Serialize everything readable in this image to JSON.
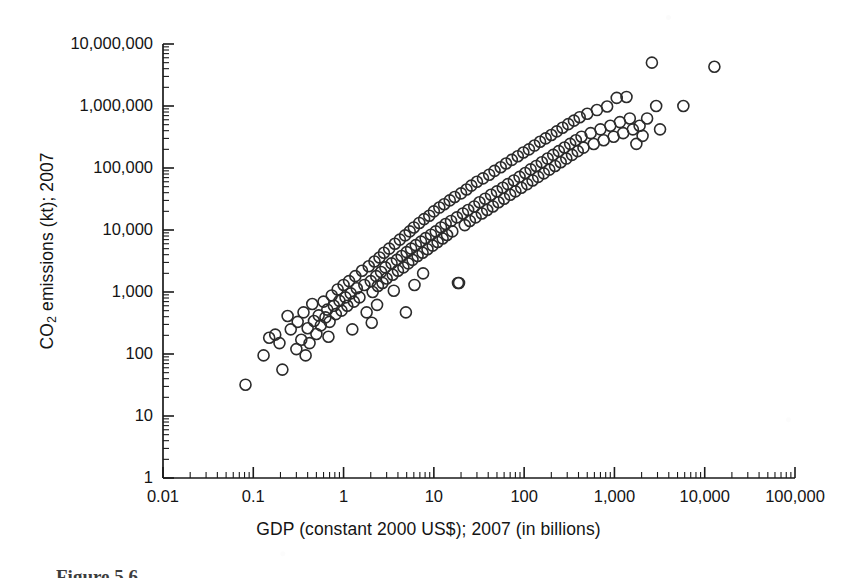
{
  "figure": {
    "caption": "Figure 5.6"
  },
  "chart_data": {
    "type": "scatter",
    "title": "",
    "xlabel": "GDP (constant 2000 US$); 2007 (in billions)",
    "ylabel": "CO2 emissions (kt); 2007",
    "ylabel_html": "CO<sub>2</sub> emissions (kt); 2007",
    "xscale": "log",
    "yscale": "log",
    "xlim": [
      0.01,
      100000
    ],
    "ylim": [
      1,
      10000000
    ],
    "grid": false,
    "legend": null,
    "marker": {
      "shape": "open-circle",
      "diameter_px": 11,
      "stroke": "#2b2b2b",
      "stroke_width": 1.6,
      "fill": "none"
    },
    "axis_style": {
      "frame": "left-and-bottom",
      "tick_direction": "in",
      "minor_ticks": true,
      "axis_color": "#1a1a1a"
    },
    "xticks": [
      0.01,
      0.1,
      1,
      10,
      100,
      1000,
      10000,
      100000
    ],
    "xtick_labels": [
      "0.01",
      "0.1",
      "1",
      "10",
      "100",
      "1,000",
      "10,000",
      "100,000"
    ],
    "yticks": [
      1,
      10,
      100,
      1000,
      10000,
      100000,
      1000000,
      10000000
    ],
    "ytick_labels": [
      "1",
      "10",
      "100",
      "1,000",
      "10,000",
      "100,000",
      "1,000,000",
      "10,000,000"
    ],
    "n_points": 186,
    "points": [
      [
        0.082,
        32
      ],
      [
        0.15,
        183
      ],
      [
        0.175,
        205
      ],
      [
        0.21,
        56
      ],
      [
        0.195,
        150
      ],
      [
        0.26,
        250
      ],
      [
        0.3,
        120
      ],
      [
        0.31,
        330
      ],
      [
        0.34,
        170
      ],
      [
        0.36,
        470
      ],
      [
        0.4,
        260
      ],
      [
        0.42,
        150
      ],
      [
        0.45,
        640
      ],
      [
        0.47,
        340
      ],
      [
        0.5,
        210
      ],
      [
        0.53,
        420
      ],
      [
        0.56,
        290
      ],
      [
        0.6,
        700
      ],
      [
        0.63,
        390
      ],
      [
        0.66,
        520
      ],
      [
        0.7,
        330
      ],
      [
        0.74,
        880
      ],
      [
        0.78,
        600
      ],
      [
        0.82,
        440
      ],
      [
        0.86,
        1100
      ],
      [
        0.9,
        720
      ],
      [
        0.95,
        500
      ],
      [
        1.0,
        1300
      ],
      [
        1.05,
        820
      ],
      [
        1.1,
        600
      ],
      [
        1.15,
        1500
      ],
      [
        1.2,
        950
      ],
      [
        1.3,
        700
      ],
      [
        1.35,
        1800
      ],
      [
        1.4,
        1150
      ],
      [
        1.5,
        820
      ],
      [
        1.6,
        2200
      ],
      [
        1.7,
        1300
      ],
      [
        1.8,
        470
      ],
      [
        1.9,
        2600
      ],
      [
        2.0,
        1500
      ],
      [
        2.1,
        1000
      ],
      [
        2.2,
        3100
      ],
      [
        2.3,
        1800
      ],
      [
        2.4,
        1250
      ],
      [
        2.5,
        3600
      ],
      [
        2.6,
        2100
      ],
      [
        2.7,
        1400
      ],
      [
        2.8,
        4300
      ],
      [
        2.9,
        2500
      ],
      [
        3.0,
        1650
      ],
      [
        3.2,
        5000
      ],
      [
        3.4,
        2900
      ],
      [
        3.5,
        1900
      ],
      [
        3.7,
        6000
      ],
      [
        3.9,
        3300
      ],
      [
        4.0,
        2200
      ],
      [
        4.2,
        7000
      ],
      [
        4.4,
        3800
      ],
      [
        4.6,
        2500
      ],
      [
        4.8,
        8200
      ],
      [
        5.0,
        4400
      ],
      [
        5.2,
        2900
      ],
      [
        5.4,
        9500
      ],
      [
        5.6,
        5000
      ],
      [
        5.8,
        3300
      ],
      [
        6.0,
        11000
      ],
      [
        6.3,
        5700
      ],
      [
        6.6,
        3800
      ],
      [
        6.9,
        13000
      ],
      [
        7.2,
        6500
      ],
      [
        7.5,
        4300
      ],
      [
        7.8,
        15000
      ],
      [
        8.1,
        7400
      ],
      [
        8.5,
        4900
      ],
      [
        8.9,
        17000
      ],
      [
        9.3,
        8400
      ],
      [
        9.7,
        5600
      ],
      [
        10.0,
        20000
      ],
      [
        10.5,
        9500
      ],
      [
        11.0,
        6400
      ],
      [
        11.5,
        23000
      ],
      [
        12.0,
        11000
      ],
      [
        12.5,
        7300
      ],
      [
        13.0,
        26000
      ],
      [
        13.5,
        12500
      ],
      [
        14.0,
        8300
      ],
      [
        15.0,
        30000
      ],
      [
        15.5,
        14000
      ],
      [
        16.0,
        9500
      ],
      [
        17.0,
        34000
      ],
      [
        18.0,
        16000
      ],
      [
        19.0,
        1400
      ],
      [
        20.0,
        39000
      ],
      [
        21.0,
        18500
      ],
      [
        22.0,
        12000
      ],
      [
        23.0,
        45000
      ],
      [
        24.0,
        21000
      ],
      [
        25.0,
        14000
      ],
      [
        26.0,
        52000
      ],
      [
        28.0,
        24000
      ],
      [
        29.0,
        16000
      ],
      [
        30.0,
        60000
      ],
      [
        32.0,
        28000
      ],
      [
        34.0,
        18500
      ],
      [
        35.0,
        68000
      ],
      [
        37.0,
        32000
      ],
      [
        39.0,
        21000
      ],
      [
        41.0,
        78000
      ],
      [
        43.0,
        37000
      ],
      [
        45.0,
        24000
      ],
      [
        47.0,
        90000
      ],
      [
        50.0,
        42000
      ],
      [
        52.0,
        28000
      ],
      [
        55.0,
        103000
      ],
      [
        58.0,
        48000
      ],
      [
        60.0,
        32000
      ],
      [
        63.0,
        118000
      ],
      [
        66.0,
        55000
      ],
      [
        70.0,
        37000
      ],
      [
        73.0,
        135000
      ],
      [
        77.0,
        63000
      ],
      [
        80.0,
        42000
      ],
      [
        85.0,
        155000
      ],
      [
        89.0,
        72000
      ],
      [
        93.0,
        48000
      ],
      [
        98.0,
        178000
      ],
      [
        103.0,
        83000
      ],
      [
        108.0,
        55000
      ],
      [
        113.0,
        200000
      ],
      [
        118.0,
        95000
      ],
      [
        124.0,
        63000
      ],
      [
        130.0,
        230000
      ],
      [
        136.0,
        108000
      ],
      [
        143.0,
        72000
      ],
      [
        150.0,
        265000
      ],
      [
        157.0,
        124000
      ],
      [
        165.0,
        82000
      ],
      [
        173.0,
        300000
      ],
      [
        182.0,
        142000
      ],
      [
        190.0,
        94000
      ],
      [
        200.0,
        340000
      ],
      [
        210.0,
        163000
      ],
      [
        220.0,
        108000
      ],
      [
        230.0,
        390000
      ],
      [
        242.0,
        187000
      ],
      [
        254.0,
        124000
      ],
      [
        266.0,
        445000
      ],
      [
        280.0,
        214000
      ],
      [
        293.0,
        142000
      ],
      [
        308.0,
        510000
      ],
      [
        323.0,
        245000
      ],
      [
        339.0,
        163000
      ],
      [
        356.0,
        580000
      ],
      [
        374.0,
        280000
      ],
      [
        392.0,
        187000
      ],
      [
        412.0,
        660000
      ],
      [
        432.0,
        320000
      ],
      [
        454.0,
        213000
      ],
      [
        500.0,
        750000
      ],
      [
        545.0,
        365000
      ],
      [
        590.0,
        244000
      ],
      [
        640.0,
        860000
      ],
      [
        700.0,
        420000
      ],
      [
        760.0,
        280000
      ],
      [
        830.0,
        980000
      ],
      [
        900.0,
        480000
      ],
      [
        980.0,
        320000
      ],
      [
        1060.0,
        1350000
      ],
      [
        1150.0,
        550000
      ],
      [
        1250.0,
        365000
      ],
      [
        1360.0,
        1400000
      ],
      [
        1480.0,
        630000
      ],
      [
        1600.0,
        420000
      ],
      [
        1750.0,
        245000
      ],
      [
        1900.0,
        480000
      ],
      [
        2050.0,
        330000
      ],
      [
        2300.0,
        630000
      ],
      [
        2600.0,
        5000000
      ],
      [
        2900.0,
        1000000
      ],
      [
        3200.0,
        420000
      ],
      [
        2.05,
        320
      ],
      [
        3.6,
        1050
      ],
      [
        4.9,
        470
      ],
      [
        6.1,
        1300
      ],
      [
        0.24,
        410
      ],
      [
        0.13,
        95
      ],
      [
        1.25,
        250
      ],
      [
        18.5,
        1400
      ],
      [
        12800.0,
        4300000
      ],
      [
        5800.0,
        1000000
      ],
      [
        0.68,
        190
      ],
      [
        2.35,
        620
      ],
      [
        7.6,
        2000
      ],
      [
        0.38,
        95
      ]
    ]
  }
}
